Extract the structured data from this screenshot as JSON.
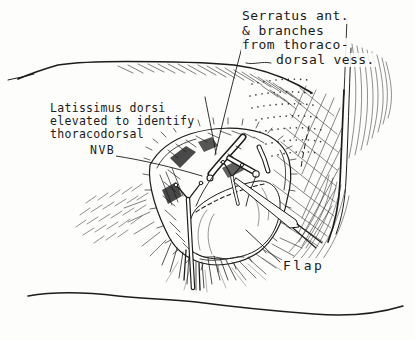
{
  "figure": {
    "colors": {
      "ink": "#1c1c1c",
      "paper": "#fdfdfc"
    }
  },
  "labels": {
    "serratus": {
      "lines": [
        "Serratus ant.",
        "& branches",
        "from thoraco-",
        "dorsal vess."
      ]
    },
    "latissimus": {
      "lines": [
        "Latissimus dorsi",
        "elevated to identify",
        "thoracodorsal",
        "NVB"
      ]
    },
    "flap": {
      "text": "Flap"
    }
  }
}
